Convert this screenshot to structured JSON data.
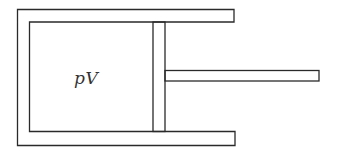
{
  "diagram": {
    "type": "piston-cylinder",
    "label": "pV",
    "colors": {
      "line": "#2a2a2a",
      "background": "#ffffff",
      "text": "#333333"
    }
  }
}
